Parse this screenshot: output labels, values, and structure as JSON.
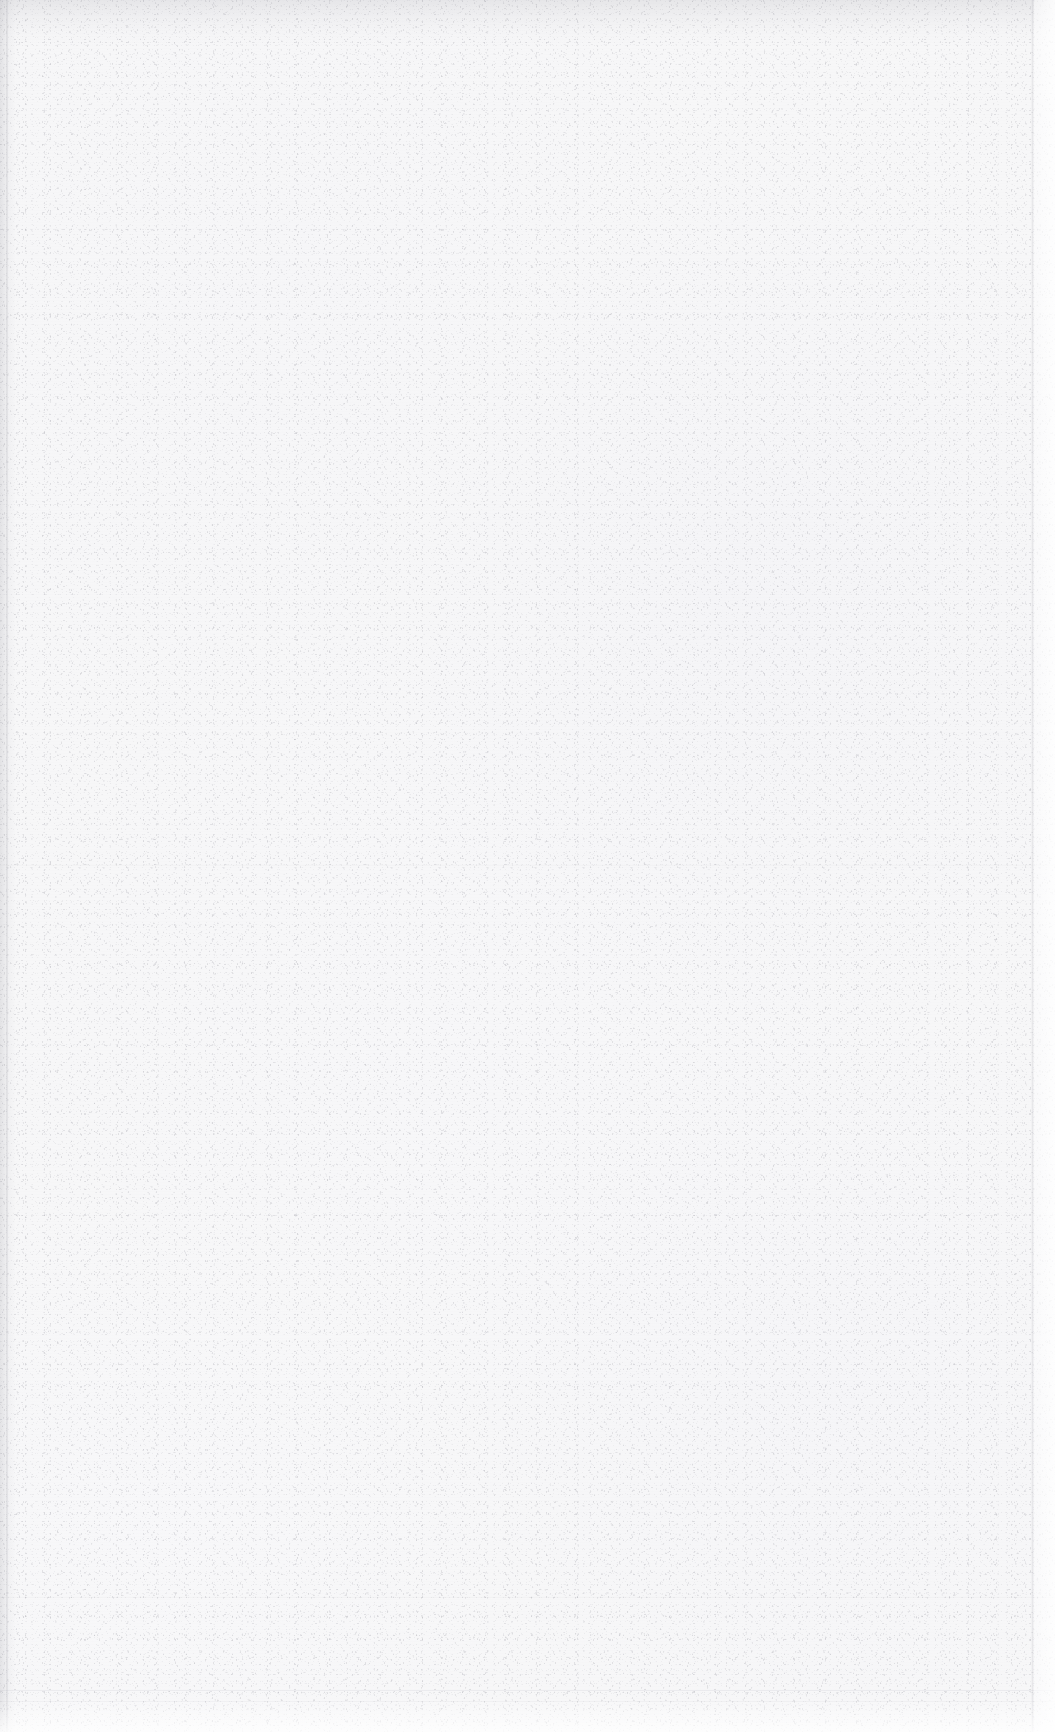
{
  "document": {
    "type": "scanned-page",
    "page_state": "blank",
    "visible_text": "",
    "headings": [],
    "paragraphs": [],
    "page_number": "",
    "header_text": "",
    "footer_text": "",
    "figures": [],
    "tables": []
  },
  "canvas": {
    "width_px": 1055,
    "height_px": 1732
  },
  "appearance": {
    "paper_color": "#f7f7f8",
    "outside_page_color": "#ffffff",
    "grain_color": "#9a9aa2",
    "edge_shadow_color": "#78788a",
    "crease_color": "#78788a"
  },
  "regions": {
    "top_edge_shadow": {
      "y": 0,
      "height": 46
    },
    "left_edge_shadow": {
      "x": 0,
      "width": 16
    },
    "left_edge_line": {
      "x": 6,
      "width": 2
    },
    "right_page_edge_line": {
      "x": 1031,
      "width": 3
    },
    "right_outside_strip": {
      "x": 1034,
      "width": 21
    },
    "bottom_light_band": {
      "y": 1698,
      "height": 34
    },
    "creases_y": [
      865,
      1597,
      1690,
      1701
    ]
  }
}
